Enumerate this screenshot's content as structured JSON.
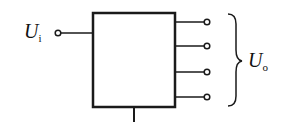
{
  "diagram": {
    "input_label": {
      "main": "U",
      "sub": "i"
    },
    "output_label": {
      "main": "U",
      "sub": "o"
    },
    "output_count": 4,
    "stroke_color": "#1a1a1a"
  }
}
